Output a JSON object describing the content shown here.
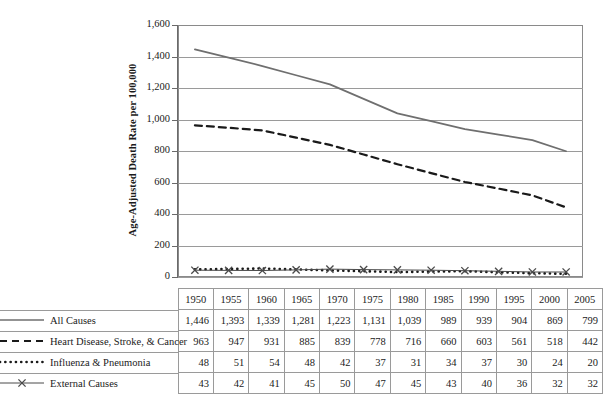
{
  "chart_data": {
    "type": "line",
    "title": "",
    "xlabel": "",
    "ylabel": "Age-Adjusted Death Rate per 100,000",
    "categories": [
      "1950",
      "1955",
      "1960",
      "1965",
      "1970",
      "1975",
      "1980",
      "1985",
      "1990",
      "1995",
      "2000",
      "2005"
    ],
    "ylim": [
      0,
      1600
    ],
    "yticks": [
      0,
      200,
      400,
      600,
      800,
      1000,
      1200,
      1400,
      1600
    ],
    "ytick_labels": [
      "0",
      "200",
      "400",
      "600",
      "800",
      "1,000",
      "1,200",
      "1,400",
      "1,600"
    ],
    "grid": true,
    "legend_position": "table-left",
    "series": [
      {
        "name": "All Causes",
        "style": "solid",
        "color": "#6f6f6f",
        "marker": "none",
        "values": [
          1446,
          1393,
          1339,
          1281,
          1223,
          1131,
          1039,
          989,
          939,
          904,
          869,
          799
        ],
        "display_values": [
          "1,446",
          "1,393",
          "1,339",
          "1,281",
          "1,223",
          "1,131",
          "1,039",
          "989",
          "939",
          "904",
          "869",
          "799"
        ]
      },
      {
        "name": "Heart Disease, Stroke, & Cancer",
        "style": "dashed",
        "color": "#1a1a1a",
        "marker": "none",
        "values": [
          963,
          947,
          931,
          885,
          839,
          778,
          716,
          660,
          603,
          561,
          518,
          442
        ],
        "display_values": [
          "963",
          "947",
          "931",
          "885",
          "839",
          "778",
          "716",
          "660",
          "603",
          "561",
          "518",
          "442"
        ]
      },
      {
        "name": "Influenza & Pneumonia",
        "style": "dotted",
        "color": "#1a1a1a",
        "marker": "none",
        "values": [
          48,
          51,
          54,
          48,
          42,
          37,
          31,
          34,
          37,
          30,
          24,
          20
        ],
        "display_values": [
          "48",
          "51",
          "54",
          "48",
          "42",
          "37",
          "31",
          "34",
          "37",
          "30",
          "24",
          "20"
        ]
      },
      {
        "name": "External Causes",
        "style": "solid-thin",
        "color": "#4a4a4a",
        "marker": "x",
        "values": [
          43,
          42,
          41,
          45,
          50,
          47,
          45,
          43,
          40,
          36,
          32,
          32
        ],
        "display_values": [
          "43",
          "42",
          "41",
          "45",
          "50",
          "47",
          "45",
          "43",
          "40",
          "36",
          "32",
          "32"
        ]
      }
    ]
  },
  "table": {
    "header_blank": "",
    "year_headers": [
      "1950",
      "1955",
      "1960",
      "1965",
      "1970",
      "1975",
      "1980",
      "1985",
      "1990",
      "1995",
      "2000",
      "2005"
    ],
    "rows": [
      {
        "label": "All Causes",
        "values": [
          "1,446",
          "1,393",
          "1,339",
          "1,281",
          "1,223",
          "1,131",
          "1,039",
          "989",
          "939",
          "904",
          "869",
          "799"
        ]
      },
      {
        "label": "Heart Disease, Stroke, & Cancer",
        "values": [
          "963",
          "947",
          "931",
          "885",
          "839",
          "778",
          "716",
          "660",
          "603",
          "561",
          "518",
          "442"
        ]
      },
      {
        "label": "Influenza & Pneumonia",
        "values": [
          "48",
          "51",
          "54",
          "48",
          "42",
          "37",
          "31",
          "34",
          "37",
          "30",
          "24",
          "20"
        ]
      },
      {
        "label": "External Causes",
        "values": [
          "43",
          "42",
          "41",
          "45",
          "50",
          "47",
          "45",
          "43",
          "40",
          "36",
          "32",
          "32"
        ]
      }
    ]
  },
  "axis": {
    "y_title": "Age-Adjusted Death Rate per 100,000"
  },
  "colors": {
    "grid": "#9a9a9a",
    "frame": "#8a8a8a",
    "all_causes": "#6f6f6f",
    "heart": "#1a1a1a",
    "influenza": "#1a1a1a",
    "external": "#4a4a4a",
    "text": "#1a1a1a",
    "background": "#ffffff"
  }
}
